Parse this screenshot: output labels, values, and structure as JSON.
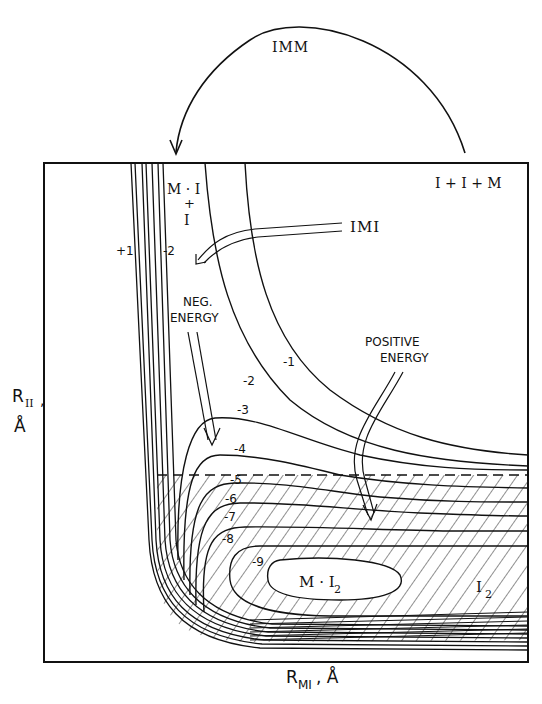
{
  "diagram": {
    "type": "potential-energy-contour-map",
    "x_axis": {
      "label_main": "R",
      "label_sub": "MI",
      "label_unit": ", Å"
    },
    "y_axis": {
      "label_main": "R",
      "label_sub": "II",
      "label_comma": ",",
      "label_unit": "Å"
    },
    "top_arrow": {
      "label": "IMM"
    },
    "regions": {
      "top_right": "I + I + M",
      "mi_line1": "M · I",
      "mi_line2": "+",
      "mi_line3": "I",
      "mi2_main": "M · I",
      "mi2_sub": "2",
      "i2_main": "I",
      "i2_sub": "2"
    },
    "annotations": {
      "imi": "IMI",
      "neg_energy_line1": "NEG.",
      "neg_energy_line2": "ENERGY",
      "pos_energy_line1": "POSITIVE",
      "pos_energy_line2": "ENERGY"
    },
    "contour_labels": {
      "plus1": "+1",
      "zero": "0",
      "minus2_top": "-2",
      "minus1": "-1",
      "minus2": "-2",
      "minus3": "-3",
      "minus4": "-4",
      "minus5": "-5",
      "minus6": "-6",
      "minus7": "-7",
      "minus8": "-8",
      "minus9": "-9"
    },
    "contour_levels": [
      1,
      0,
      -1,
      -2,
      -3,
      -4,
      -5,
      -6,
      -7,
      -8,
      -9
    ],
    "hatched_region": "energy below -5 (dashed boundary)"
  }
}
